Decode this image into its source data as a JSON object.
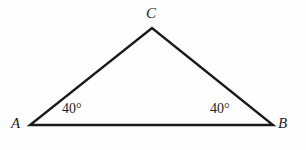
{
  "figure": {
    "kind": "geometry-diagram",
    "shape": "triangle",
    "background_color": "#fefefe",
    "stroke_color": "#1a1a1a",
    "stroke_width": 2.4,
    "canvas": {
      "width": 306,
      "height": 150
    }
  },
  "vertices": {
    "A": {
      "label": "A",
      "x": 30,
      "y": 125
    },
    "B": {
      "label": "B",
      "x": 273,
      "y": 125
    },
    "C": {
      "label": "C",
      "x": 152,
      "y": 28
    }
  },
  "angles": {
    "at_A": {
      "text": "40°",
      "value": 40,
      "unit": "degrees"
    },
    "at_B": {
      "text": "40°",
      "value": 40,
      "unit": "degrees"
    }
  },
  "sides": {
    "AB": {
      "from": "A",
      "to": "B"
    },
    "AC": {
      "from": "A",
      "to": "C"
    },
    "CB": {
      "from": "C",
      "to": "B"
    }
  },
  "chart_data": {
    "type": "scatter",
    "title": "",
    "xlabel": "",
    "ylabel": "",
    "xlim": [
      0,
      306
    ],
    "ylim": [
      0,
      150
    ],
    "grid": false,
    "legend": "none",
    "series": [
      {
        "name": "triangle-ABC",
        "points": [
          {
            "label": "A",
            "x": 30,
            "y": 125
          },
          {
            "label": "B",
            "x": 273,
            "y": 125
          },
          {
            "label": "C",
            "x": 152,
            "y": 28
          }
        ],
        "closed": true
      }
    ],
    "annotations": [
      {
        "text": "C",
        "x": 153,
        "y": 14
      },
      {
        "text": "A",
        "x": 18,
        "y": 124
      },
      {
        "text": "B",
        "x": 285,
        "y": 124
      },
      {
        "text": "40°",
        "x": 77,
        "y": 110
      },
      {
        "text": "40°",
        "x": 226,
        "y": 110
      }
    ]
  }
}
